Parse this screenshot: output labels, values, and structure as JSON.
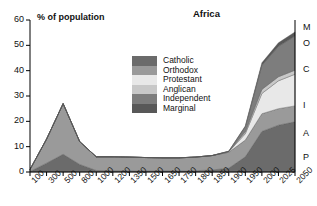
{
  "chart_data": {
    "type": "area",
    "title": "Africa",
    "xlabel": "",
    "ylabel": "% of population",
    "ylim": [
      0,
      60
    ],
    "yticks": [
      0,
      10,
      20,
      30,
      40,
      50,
      60
    ],
    "grid": false,
    "stacked": true,
    "legend_position": "center",
    "categories": [
      "100",
      "300",
      "500",
      "800",
      "1000",
      "1200",
      "1350",
      "1500",
      "1650",
      "1750",
      "1800",
      "1850",
      "1900",
      "1950",
      "2000",
      "2025",
      "2050"
    ],
    "series": [
      {
        "name": "Catholic",
        "color": "#6b6b6b",
        "values": [
          0.2,
          3.5,
          7.0,
          3.0,
          0.6,
          0.5,
          0.5,
          0.4,
          0.4,
          0.4,
          0.5,
          0.8,
          1.5,
          6.0,
          16.0,
          18.5,
          19.8
        ]
      },
      {
        "name": "Orthodox",
        "color": "#9a9a9a",
        "values": [
          0.8,
          9.5,
          20.0,
          9.0,
          5.4,
          5.5,
          5.4,
          5.3,
          5.2,
          5.2,
          5.4,
          5.7,
          6.3,
          6.6,
          7.0,
          6.5,
          6.3
        ]
      },
      {
        "name": "Protestant",
        "color": "#e8e8e8",
        "values": [
          0,
          0,
          0,
          0,
          0,
          0,
          0,
          0,
          0,
          0,
          0,
          0,
          0.2,
          2.5,
          8.0,
          11.0,
          12.5
        ]
      },
      {
        "name": "Anglican",
        "color": "#c8c8c8",
        "values": [
          0,
          0,
          0,
          0,
          0,
          0,
          0,
          0,
          0,
          0,
          0,
          0,
          0.1,
          0.8,
          1.6,
          1.6,
          1.6
        ]
      },
      {
        "name": "Independent",
        "color": "#7d7d7d",
        "values": [
          0,
          0,
          0,
          0,
          0,
          0,
          0,
          0,
          0,
          0,
          0,
          0,
          0.1,
          2.0,
          9.5,
          12.0,
          13.5
        ]
      },
      {
        "name": "Marginal",
        "color": "#585858",
        "values": [
          0,
          0,
          0,
          0,
          0,
          0,
          0,
          0,
          0,
          0,
          0,
          0,
          0,
          0.3,
          1.0,
          1.4,
          1.6
        ]
      }
    ],
    "right_axis_labels": [
      "M",
      "O",
      "C",
      "I",
      "A",
      "P"
    ]
  },
  "axis": {
    "ylabel_text": "% of population"
  }
}
